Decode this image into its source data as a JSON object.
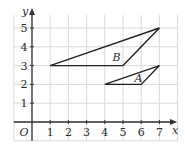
{
  "diagram": {
    "type": "coordinate-grid",
    "axes": {
      "x_label": "x",
      "y_label": "y",
      "origin_label": "O",
      "x_ticks": [
        "1",
        "2",
        "3",
        "4",
        "5",
        "6",
        "7"
      ],
      "y_ticks": [
        "1",
        "2",
        "3",
        "4",
        "5"
      ]
    },
    "shapes": [
      {
        "name": "A",
        "label": "A",
        "vertices": [
          [
            4,
            2
          ],
          [
            6,
            2
          ],
          [
            7,
            3
          ]
        ],
        "label_pos": [
          5.85,
          2.35
        ]
      },
      {
        "name": "B",
        "label": "B",
        "vertices": [
          [
            1,
            3
          ],
          [
            5,
            3
          ],
          [
            7,
            5
          ]
        ],
        "label_pos": [
          4.65,
          3.45
        ]
      }
    ],
    "colors": {
      "grid": "#d9d9d9",
      "axis": "#333333",
      "shape": "#222222"
    }
  }
}
